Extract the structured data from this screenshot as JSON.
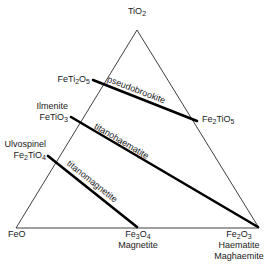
{
  "diagram": {
    "type": "ternary-phase-diagram",
    "colors": {
      "outline": "#2a2a2a",
      "tieline": "#000000",
      "text": "#1a1a1a",
      "background": "#ffffff"
    },
    "vertices": {
      "top": {
        "formula": "TiO",
        "formula_sub": "2",
        "x": 137,
        "y": 22
      },
      "bottom_left": {
        "formula": "FeO",
        "x": 14,
        "y": 233
      },
      "bottom_right": {
        "formula": "Fe",
        "formula_sub1": "2",
        "formula_mid": "O",
        "formula_sub2": "3",
        "mineral1": "Haematite",
        "mineral2": "Maghaemite",
        "x": 239,
        "y": 233
      }
    },
    "edge_points": [
      {
        "id": "fe-ti2-o5",
        "formula": "FeTi",
        "sub1": "2",
        "mid": "O",
        "sub2": "5",
        "side": "left"
      },
      {
        "id": "ilmenite",
        "mineral": "Ilmenite",
        "formula": "FeTiO",
        "sub": "3",
        "side": "left"
      },
      {
        "id": "ulvospinel",
        "mineral": "Ulvospinel",
        "formula": "Fe",
        "sub1": "2",
        "mid": "TiO",
        "sub2": "4",
        "side": "left"
      },
      {
        "id": "fe2-ti-o5",
        "formula": "Fe",
        "sub1": "2",
        "mid": "TiO",
        "sub2": "5",
        "side": "right"
      },
      {
        "id": "magnetite",
        "formula": "Fe",
        "sub1": "3",
        "mid": "O",
        "sub2": "4",
        "mineral": "Magnetite",
        "side": "bottom"
      }
    ],
    "solid_solution_series": [
      {
        "id": "pseudobrookite",
        "label": "pseudobrookite",
        "from": "FeTi2O5",
        "to": "Fe2TiO5"
      },
      {
        "id": "titanohaematite",
        "label": "titanohaematite",
        "from": "FeTiO3",
        "to": "Fe2O3"
      },
      {
        "id": "titanomagnetite",
        "label": "titanomagnetite",
        "from": "Fe2TiO4",
        "to": "Fe3O4"
      }
    ]
  }
}
